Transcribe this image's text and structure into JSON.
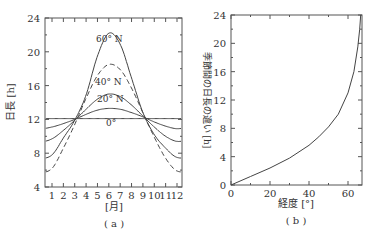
{
  "chart_data": [
    {
      "type": "line",
      "panel_label": "(a)",
      "xlabel": "[月]",
      "ylabel": "日長 [h]",
      "x": [
        1,
        2,
        3,
        4,
        5,
        6,
        7,
        8,
        9,
        10,
        11,
        12
      ],
      "xticks": [
        "1",
        "2",
        "3",
        "4",
        "5",
        "6",
        "7",
        "8",
        "9",
        "10",
        "11",
        "12"
      ],
      "yticks": [
        "4",
        "8",
        "12",
        "16",
        "20",
        "24"
      ],
      "ylim": [
        4,
        24
      ],
      "series": [
        {
          "name": "0°",
          "style": "solid",
          "values": [
            12.1,
            12.1,
            12.1,
            12.1,
            12.1,
            12.1,
            12.1,
            12.1,
            12.1,
            12.1,
            12.1,
            12.1
          ]
        },
        {
          "name": "20° N",
          "style": "solid",
          "values": [
            11.1,
            11.5,
            12.0,
            12.6,
            13.1,
            13.3,
            13.2,
            12.8,
            12.3,
            11.7,
            11.2,
            10.9
          ]
        },
        {
          "name": "40° N",
          "style": "solid",
          "values": [
            9.7,
            10.7,
            11.9,
            13.2,
            14.4,
            15.0,
            14.7,
            13.7,
            12.4,
            11.1,
            10.0,
            9.4
          ]
        },
        {
          "name": "dashed",
          "style": "dashed",
          "values": [
            6.2,
            8.6,
            11.4,
            14.5,
            17.2,
            18.5,
            17.9,
            15.7,
            12.8,
            9.9,
            7.4,
            5.9
          ]
        },
        {
          "name": "60° N",
          "style": "solid",
          "values": [
            7.8,
            9.8,
            11.9,
            14.9,
            19.5,
            22.2,
            20.9,
            16.9,
            12.8,
            10.2,
            8.6,
            7.5
          ]
        }
      ],
      "annotations": [
        "60° N",
        "40° N",
        "20° N",
        "0°"
      ],
      "grid": false
    },
    {
      "type": "line",
      "panel_label": "(b)",
      "xlabel": "経度 [°]",
      "ylabel": "季節間の日長の違い [h]",
      "xticks": [
        "0",
        "20",
        "40",
        "60"
      ],
      "yticks": [
        "0",
        "4",
        "8",
        "12",
        "16",
        "20",
        "24"
      ],
      "xlim": [
        0,
        67
      ],
      "ylim": [
        0,
        24
      ],
      "series": [
        {
          "name": "日長差",
          "x": [
            0,
            10,
            20,
            30,
            40,
            45,
            50,
            55,
            60,
            63,
            65,
            66,
            66.5
          ],
          "values": [
            0,
            1.2,
            2.4,
            3.8,
            5.6,
            6.8,
            8.2,
            10.0,
            13.0,
            16.0,
            19.5,
            22.0,
            24.0
          ]
        }
      ],
      "grid": false
    }
  ],
  "labels": {
    "a_ylabel": "日長 [h]",
    "a_xlabel": "[月]",
    "a_panel": "( a )",
    "b_ylabel": "季節間の日長の違い [h]",
    "b_xlabel": "経度 [°]",
    "b_panel": "( b )",
    "ann_60": "60° N",
    "ann_40": "40° N",
    "ann_20": "20° N",
    "ann_0": "0°"
  }
}
